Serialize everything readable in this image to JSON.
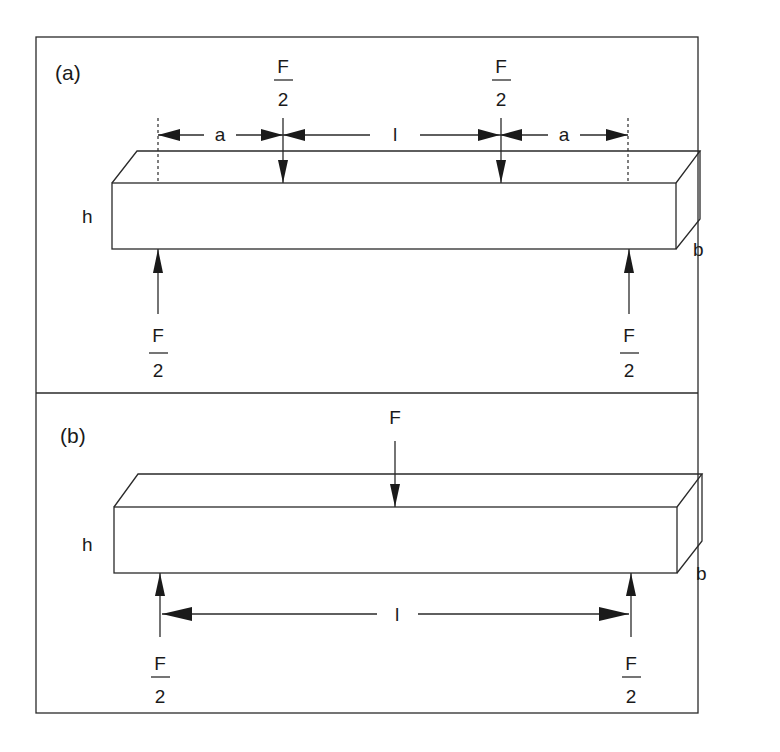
{
  "figure": {
    "panels": [
      {
        "id": "a",
        "label": "(a)",
        "type": "four-point-bending",
        "load_top_left": {
          "numerator": "F",
          "denominator": "2"
        },
        "load_top_right": {
          "numerator": "F",
          "denominator": "2"
        },
        "support_left": {
          "numerator": "F",
          "denominator": "2"
        },
        "support_right": {
          "numerator": "F",
          "denominator": "2"
        },
        "dim_left": "a",
        "dim_middle": "l",
        "dim_right": "a",
        "height_label": "h",
        "width_label": "b"
      },
      {
        "id": "b",
        "label": "(b)",
        "type": "three-point-bending",
        "load_top": "F",
        "support_left": {
          "numerator": "F",
          "denominator": "2"
        },
        "support_right": {
          "numerator": "F",
          "denominator": "2"
        },
        "span_label": "l",
        "height_label": "h",
        "width_label": "b"
      }
    ]
  }
}
